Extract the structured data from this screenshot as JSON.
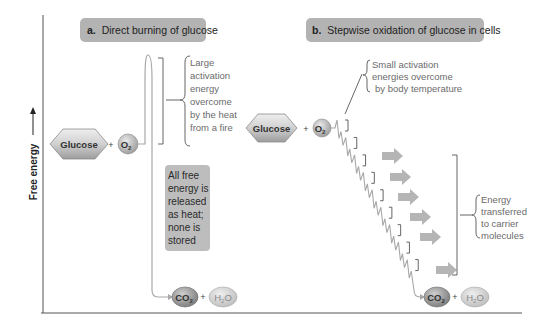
{
  "diagram": {
    "y_axis_label": "Free energy",
    "panels": [
      {
        "id": "a",
        "title_prefix": "a.",
        "title": "Direct burning of glucose",
        "reactants": [
          "Glucose",
          "+",
          "O2"
        ],
        "products": [
          "CO2",
          "+",
          "H2O"
        ],
        "activation_note": [
          "Large",
          "activation",
          "energy",
          "overcome",
          "by the heat",
          "from a fire"
        ],
        "release_note": [
          "All free",
          "energy is",
          "released",
          "as heat;",
          "none is",
          "stored"
        ]
      },
      {
        "id": "b",
        "title_prefix": "b.",
        "title": "Stepwise oxidation of glucose in cells",
        "reactants": [
          "Glucose",
          "+",
          "O2"
        ],
        "products": [
          "CO2",
          "+",
          "H2O"
        ],
        "activation_note": [
          "Small activation",
          "energies overcome",
          "by body temperature"
        ],
        "transfer_note": [
          "Energy",
          "transferred",
          "to carrier",
          "molecules"
        ],
        "step_count": 9,
        "arrow_count": 6
      }
    ],
    "colors": {
      "title_box": "#b3b3b3",
      "note_box": "#bdbdbd",
      "glucose_fill": "#cfcfcf",
      "o2_fill": "#c8c8c8",
      "co2_fill": "#a9a9a9",
      "h2o_fill": "#d4d4d4",
      "curve": "#a8a8a8",
      "arrow": "#b5b5b5",
      "axis": "#555555"
    }
  }
}
